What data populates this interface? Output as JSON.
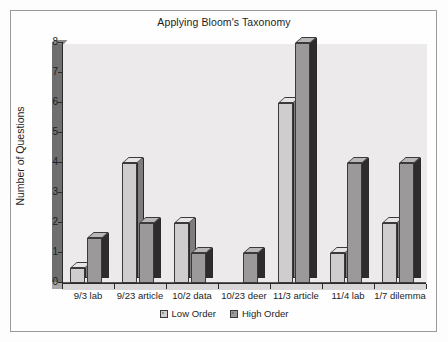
{
  "chart_data": {
    "type": "bar",
    "title": "Applying Bloom's Taxonomy",
    "xlabel": "",
    "ylabel": "Number of Questions",
    "ylim": [
      0,
      8
    ],
    "yticks": [
      "0",
      "1",
      "2",
      "3",
      "4",
      "5",
      "6",
      "7",
      "8"
    ],
    "grid": false,
    "legend_position": "bottom",
    "style": "3d-clustered-bars",
    "categories": [
      "9/3 lab",
      "9/23 article",
      "10/2 data",
      "10/23 deer",
      "11/3 article",
      "11/4 lab",
      "1/7 dilemma"
    ],
    "series": [
      {
        "name": "Low Order",
        "color": "#cfcdcd",
        "values": [
          0.5,
          4,
          2,
          0,
          6,
          1,
          2
        ]
      },
      {
        "name": "High Order",
        "color": "#9b9999",
        "values": [
          1.5,
          2,
          1,
          1,
          8,
          4,
          4
        ]
      }
    ]
  },
  "legend": {
    "items": [
      {
        "label": "Low Order"
      },
      {
        "label": "High Order"
      }
    ]
  },
  "colors": {
    "plot_background": "#eceaea",
    "axis": "#2b2b2b",
    "page_background": "#fdfdfd",
    "frame_border": "#9a9a9a"
  }
}
